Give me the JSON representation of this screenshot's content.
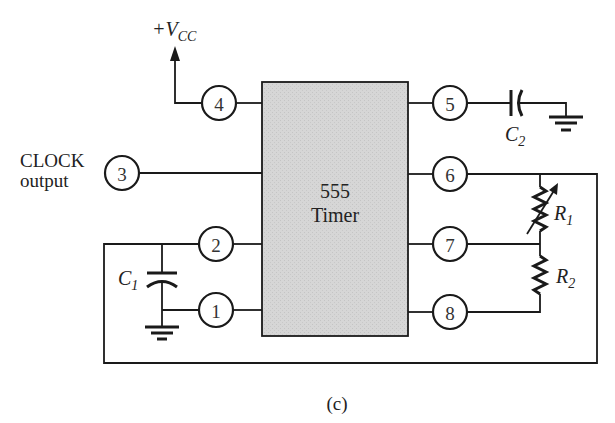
{
  "figure": {
    "caption": "(c)",
    "chip": {
      "line1": "555",
      "line2": "Timer",
      "fill": "#d4d4d4"
    },
    "supply": {
      "prefix": "+V",
      "sub": "CC"
    },
    "clock_label": {
      "line1": "CLOCK",
      "line2": "output"
    },
    "pins": [
      {
        "num": "1",
        "label": "1"
      },
      {
        "num": "2",
        "label": "2"
      },
      {
        "num": "3",
        "label": "3"
      },
      {
        "num": "4",
        "label": "4"
      },
      {
        "num": "5",
        "label": "5"
      },
      {
        "num": "6",
        "label": "6"
      },
      {
        "num": "7",
        "label": "7"
      },
      {
        "num": "8",
        "label": "8"
      }
    ],
    "components": {
      "c1": {
        "letter": "C",
        "sub": "1"
      },
      "c2": {
        "letter": "C",
        "sub": "2"
      },
      "r1": {
        "letter": "R",
        "sub": "1"
      },
      "r2": {
        "letter": "R",
        "sub": "2"
      }
    }
  }
}
